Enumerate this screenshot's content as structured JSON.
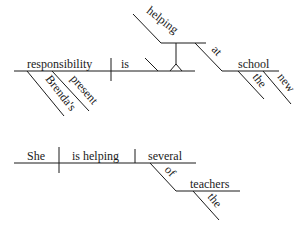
{
  "diagrams": [
    {
      "sentence_words": {
        "subject": "responsibility",
        "verb": "is",
        "gerund_complement": "helping",
        "preposition": "at",
        "object_of_preposition": "school",
        "modifiers_subject": [
          "Brenda's",
          "present"
        ],
        "modifiers_object": [
          "the",
          "new"
        ]
      }
    },
    {
      "sentence_words": {
        "subject": "She",
        "verb": "is helping",
        "object": "several",
        "preposition": "of",
        "object_of_preposition": "teachers",
        "modifiers_object": [
          "the"
        ]
      }
    }
  ]
}
